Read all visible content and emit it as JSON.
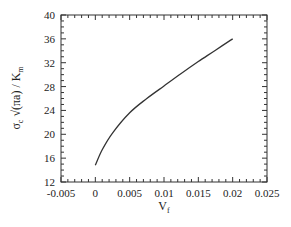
{
  "chart_data": {
    "type": "line",
    "title": "",
    "xlabel": "V_f",
    "xlabel_main": "V",
    "xlabel_sub": "f",
    "ylabel": "σ_c √(πa) / K_m",
    "ylabel_parts": {
      "sigma": "σ",
      "sigma_sub": "c",
      "middle": " √(πa) / K",
      "k_sub": "m"
    },
    "xlim": [
      -0.005,
      0.025
    ],
    "ylim": [
      12,
      40
    ],
    "x_ticks": [
      -0.005,
      0,
      0.005,
      0.01,
      0.015,
      0.02,
      0.025
    ],
    "x_tick_labels": [
      "-0.005",
      "0",
      "0.005",
      "0.01",
      "0.015",
      "0.02",
      "0.025"
    ],
    "y_ticks": [
      12,
      16,
      20,
      24,
      28,
      32,
      36,
      40
    ],
    "y_tick_labels": [
      "12",
      "16",
      "20",
      "24",
      "28",
      "32",
      "36",
      "40"
    ],
    "grid": false,
    "legend": null,
    "series": [
      {
        "name": "curve",
        "color": "#333333",
        "x": [
          0,
          0.001,
          0.0025,
          0.005,
          0.0075,
          0.01,
          0.0125,
          0.015,
          0.0175,
          0.02
        ],
        "y": [
          14.8,
          17.4,
          20.2,
          23.6,
          26.0,
          28.1,
          30.2,
          32.2,
          34.1,
          36.0
        ]
      }
    ]
  }
}
